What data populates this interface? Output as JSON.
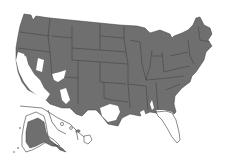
{
  "map": {
    "subject": "United States range map",
    "colors": {
      "present": "#6f6f6f",
      "absent": "#ffffff",
      "border": "#3c3c3c"
    },
    "regions": [
      {
        "name": "Contiguous United States",
        "shaded": "mostly"
      },
      {
        "name": "Alaska inset",
        "shaded": "partially"
      },
      {
        "name": "Hawaii inset",
        "shaded": "partially"
      }
    ],
    "unshaded_areas": [
      "California coast and Central Valley",
      "Southern Nevada / Arizona desert",
      "Southern and western Texas",
      "Florida peninsula",
      "Coastal Louisiana"
    ]
  }
}
